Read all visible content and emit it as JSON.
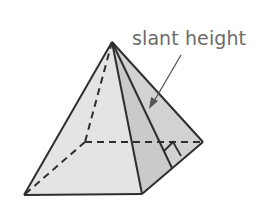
{
  "figure": {
    "label": "slant height",
    "colors": {
      "stroke": "#2e2e2e",
      "face_left": "#e3e3e3",
      "face_right": "#cfcfcf",
      "face_mid": "#d9d9d9",
      "label": "#6b6b6b",
      "arrow": "#555555"
    },
    "points": {
      "apex": [
        112,
        42
      ],
      "base_front_left": [
        24,
        195
      ],
      "base_front_right": [
        142,
        194
      ],
      "base_right": [
        203,
        142
      ],
      "base_back_hidden": [
        85,
        142
      ],
      "slant_foot": [
        172,
        168
      ]
    },
    "annotations": {
      "right_angle_marker": true,
      "hidden_edges_dashed": true,
      "arrow_from": [
        181,
        55
      ],
      "arrow_to": [
        150,
        108
      ]
    }
  }
}
